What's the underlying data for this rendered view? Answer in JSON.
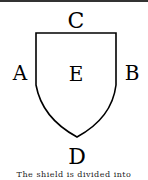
{
  "diagram": {
    "labels": {
      "top": "C",
      "left": "A",
      "right": "B",
      "center": "E",
      "bottom": "D"
    },
    "shape": "shield",
    "stroke_color": "#000000"
  },
  "caption": "The shield is divided into"
}
